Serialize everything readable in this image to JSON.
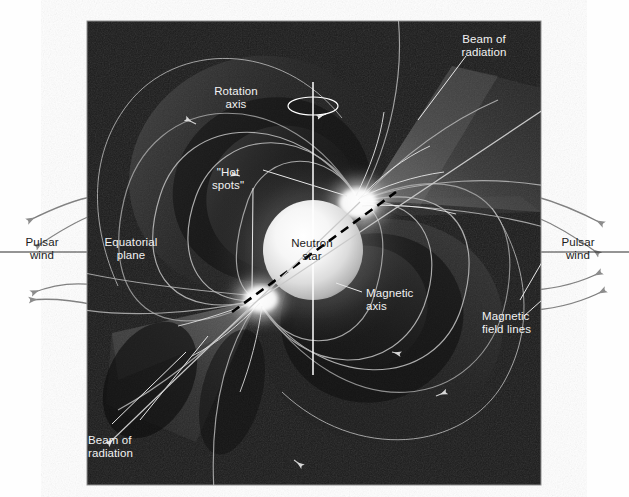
{
  "figure": {
    "panel": {
      "x": 87,
      "y": 21,
      "width": 454,
      "height": 464,
      "background_color": "#1b1b1b",
      "border_color": "#8a8a8a"
    },
    "canvas": {
      "width": 629,
      "height": 497,
      "background_color": "#ffffff"
    },
    "palette": {
      "panel_dark": "#1b1b1b",
      "label_light": "#f2f2f2",
      "label_dark": "#1c1c1c",
      "field_line": "#b9b9b9",
      "wind_arrow": "#7c7c7c",
      "equatorial_line": "#2b2b2b",
      "rotation_axis": "#ffffff",
      "magnetic_axis": "#000000",
      "star_core": "#ffffff",
      "star_edge": "#9a9a9a",
      "beam_cone": "#6f6f6f"
    }
  },
  "labels": [
    {
      "id": "beam-of-radiation-top",
      "text": "Beam of\nradiation",
      "tone": "light",
      "x": 468,
      "y": 33,
      "align": "left"
    },
    {
      "id": "rotation-axis",
      "text": "Rotation\naxis",
      "tone": "light",
      "x": 236,
      "y": 85,
      "align": "center"
    },
    {
      "id": "hot-spots",
      "text": "\"Hot\nspots\"",
      "tone": "light",
      "x": 228,
      "y": 167,
      "align": "center"
    },
    {
      "id": "equatorial-plane",
      "text": "Equatorial\nplane",
      "tone": "light",
      "x": 94,
      "y": 236,
      "align": "left"
    },
    {
      "id": "pulsar-wind-left",
      "text": "Pulsar\nwind",
      "tone": "dark",
      "x": 18,
      "y": 236,
      "align": "left"
    },
    {
      "id": "pulsar-wind-right",
      "text": "Pulsar\nwind",
      "tone": "dark",
      "x": 553,
      "y": 236,
      "align": "left"
    },
    {
      "id": "neutron-star",
      "text": "Neutron\nstar",
      "tone": "dark",
      "x": 291,
      "y": 238,
      "align": "center"
    },
    {
      "id": "magnetic-axis",
      "text": "Magnetic\naxis",
      "tone": "light",
      "x": 364,
      "y": 287,
      "align": "left"
    },
    {
      "id": "magnetic-field-lines",
      "text": "Magnetic\nfield lines",
      "tone": "light",
      "x": 483,
      "y": 310,
      "align": "left"
    },
    {
      "id": "beam-of-radiation-bottom",
      "text": "Beam of\nradiation",
      "tone": "light",
      "x": 88,
      "y": 435,
      "align": "left"
    }
  ],
  "diagram_elements": {
    "neutron_star": {
      "center_x": 313,
      "center_y": 250,
      "radius": 50,
      "description": "bright glowing sphere"
    },
    "rotation_axis": {
      "x": 313,
      "top_y": 82,
      "bottom_y": 375,
      "spin_arrow": true
    },
    "magnetic_axis": {
      "angle_deg": -35,
      "style": "dashed",
      "color": "#000000"
    },
    "hot_spots": [
      {
        "id": "hot-spot-upper-right",
        "x": 360,
        "y": 203
      },
      {
        "id": "hot-spot-lower-left",
        "x": 260,
        "y": 300
      }
    ],
    "radiation_beams": [
      {
        "id": "beam-upper-right",
        "direction": "up-right"
      },
      {
        "id": "beam-lower-left",
        "direction": "down-left"
      }
    ],
    "pulsar_wind_arrows": {
      "left_count": 4,
      "right_count": 4
    },
    "equatorial_plane_line": {
      "y": 252,
      "from_x": 0,
      "to_x": 629
    }
  }
}
